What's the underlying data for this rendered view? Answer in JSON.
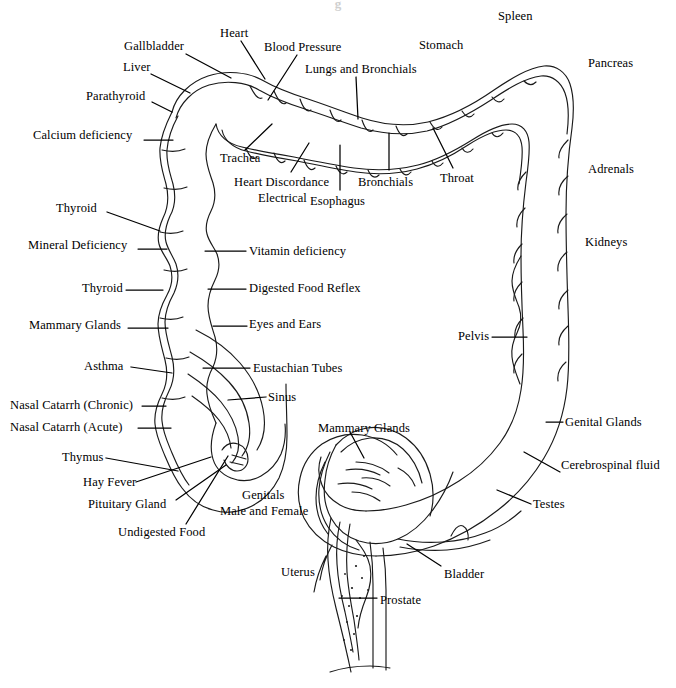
{
  "document": {
    "title_fragment": "g",
    "kind": "colon-reflex-chart",
    "background_color": "#ffffff",
    "ink_color": "#1a1a1a"
  },
  "diagram": {
    "name": "colon-outline",
    "parts": [
      "ascending-colon",
      "hepatic-flexure",
      "transverse-colon",
      "splenic-flexure",
      "descending-colon",
      "sigmoid-colon",
      "cecum",
      "rectum"
    ]
  },
  "labels": [
    {
      "id": "gallbladder",
      "text": "Gallbladder",
      "x": 124,
      "y": 40,
      "align": "left",
      "leader": [
        [
          186,
          54
        ],
        [
          231,
          78
        ]
      ]
    },
    {
      "id": "heart",
      "text": "Heart",
      "x": 220,
      "y": 27,
      "align": "left",
      "leader": [
        [
          241,
          41
        ],
        [
          265,
          79
        ]
      ]
    },
    {
      "id": "blood-pressure",
      "text": "Blood Pressure",
      "x": 264,
      "y": 41,
      "align": "left",
      "leader": [
        [
          297,
          55
        ],
        [
          268,
          100
        ]
      ]
    },
    {
      "id": "liver",
      "text": "Liver",
      "x": 123,
      "y": 61,
      "align": "left",
      "leader": [
        [
          151,
          74
        ],
        [
          190,
          93
        ]
      ]
    },
    {
      "id": "lungs-and-bronchials",
      "text": "Lungs and Bronchials",
      "x": 305,
      "y": 63,
      "align": "left",
      "leader": [
        [
          356,
          77
        ],
        [
          358,
          119
        ]
      ]
    },
    {
      "id": "stomach",
      "text": "Stomach",
      "x": 419,
      "y": 39,
      "align": "left",
      "leader": null
    },
    {
      "id": "spleen",
      "text": "Spleen",
      "x": 498,
      "y": 10,
      "align": "left",
      "leader": null
    },
    {
      "id": "pancreas",
      "text": "Pancreas",
      "x": 588,
      "y": 57,
      "align": "left",
      "leader": null
    },
    {
      "id": "parathyroid",
      "text": "Parathyroid",
      "x": 86,
      "y": 90,
      "align": "left",
      "leader": [
        [
          152,
          102
        ],
        [
          172,
          112
        ]
      ]
    },
    {
      "id": "calcium-deficiency",
      "text": "Calcium deficiency",
      "x": 33,
      "y": 129,
      "align": "left",
      "leader": [
        [
          144,
          140
        ],
        [
          173,
          140
        ]
      ]
    },
    {
      "id": "trachea",
      "text": "Trachea",
      "x": 220,
      "y": 152,
      "align": "left",
      "leader": [
        [
          245,
          150
        ],
        [
          272,
          124
        ]
      ]
    },
    {
      "id": "heart-discordance",
      "text": "Heart Discordance",
      "x": 234,
      "y": 176,
      "align": "left",
      "leader": [
        [
          291,
          172
        ],
        [
          309,
          143
        ]
      ]
    },
    {
      "id": "electrical",
      "text": "Electrical",
      "x": 258,
      "y": 192,
      "align": "left",
      "leader": null
    },
    {
      "id": "esophagus",
      "text": "Esophagus",
      "x": 310,
      "y": 195,
      "align": "left",
      "leader": [
        [
          340,
          190
        ],
        [
          340,
          145
        ]
      ]
    },
    {
      "id": "bronchials",
      "text": "Bronchials",
      "x": 358,
      "y": 176,
      "align": "left",
      "leader": [
        [
          389,
          170
        ],
        [
          389,
          133
        ]
      ]
    },
    {
      "id": "throat",
      "text": "Throat",
      "x": 440,
      "y": 172,
      "align": "left",
      "leader": [
        [
          453,
          168
        ],
        [
          433,
          128
        ]
      ]
    },
    {
      "id": "adrenals",
      "text": "Adrenals",
      "x": 588,
      "y": 163,
      "align": "left",
      "leader": null
    },
    {
      "id": "kidneys",
      "text": "Kidneys",
      "x": 585,
      "y": 236,
      "align": "left",
      "leader": null
    },
    {
      "id": "thyroid-upper",
      "text": "Thyroid",
      "x": 56,
      "y": 202,
      "align": "left",
      "leader": [
        [
          107,
          212
        ],
        [
          160,
          231
        ]
      ]
    },
    {
      "id": "mineral-deficiency",
      "text": "Mineral Deficiency",
      "x": 28,
      "y": 239,
      "align": "left",
      "leader": [
        [
          138,
          249
        ],
        [
          167,
          249
        ]
      ]
    },
    {
      "id": "vitamin-deficiency",
      "text": "Vitamin deficiency",
      "x": 249,
      "y": 245,
      "align": "left",
      "leader": [
        [
          205,
          251
        ],
        [
          246,
          251
        ]
      ]
    },
    {
      "id": "thyroid-lower",
      "text": "Thyroid",
      "x": 82,
      "y": 282,
      "align": "left",
      "leader": [
        [
          126,
          290
        ],
        [
          163,
          290
        ]
      ]
    },
    {
      "id": "digested-food-reflex",
      "text": "Digested Food Reflex",
      "x": 249,
      "y": 282,
      "align": "left",
      "leader": [
        [
          208,
          289
        ],
        [
          246,
          289
        ]
      ]
    },
    {
      "id": "mammary-glands-left",
      "text": "Mammary Glands",
      "x": 29,
      "y": 319,
      "align": "left",
      "leader": [
        [
          128,
          328
        ],
        [
          168,
          328
        ]
      ]
    },
    {
      "id": "eyes-and-ears",
      "text": "Eyes and Ears",
      "x": 249,
      "y": 318,
      "align": "left",
      "leader": [
        [
          213,
          326
        ],
        [
          247,
          326
        ]
      ]
    },
    {
      "id": "pelvis",
      "text": "Pelvis",
      "x": 458,
      "y": 330,
      "align": "left",
      "leader": [
        [
          492,
          337
        ],
        [
          527,
          337
        ]
      ]
    },
    {
      "id": "asthma",
      "text": "Asthma",
      "x": 84,
      "y": 360,
      "align": "left",
      "leader": [
        [
          131,
          367
        ],
        [
          172,
          373
        ]
      ]
    },
    {
      "id": "eustachian-tubes",
      "text": "Eustachian Tubes",
      "x": 253,
      "y": 362,
      "align": "left",
      "leader": [
        [
          203,
          368
        ],
        [
          250,
          368
        ]
      ]
    },
    {
      "id": "nasal-catarrh-chronic",
      "text": "Nasal Catarrh (Chronic)",
      "x": 10,
      "y": 399,
      "align": "left",
      "leader": [
        [
          142,
          406
        ],
        [
          166,
          406
        ]
      ]
    },
    {
      "id": "sinus",
      "text": "Sinus",
      "x": 268,
      "y": 391,
      "align": "left",
      "leader": [
        [
          228,
          400
        ],
        [
          266,
          397
        ]
      ]
    },
    {
      "id": "nasal-catarrh-acute",
      "text": "Nasal Catarrh (Acute)",
      "x": 10,
      "y": 421,
      "align": "left",
      "leader": [
        [
          138,
          428
        ],
        [
          171,
          428
        ]
      ]
    },
    {
      "id": "mammary-glands-right",
      "text": "Mammary Glands",
      "x": 318,
      "y": 422,
      "align": "left",
      "leader": [
        [
          350,
          432
        ],
        [
          364,
          458
        ]
      ]
    },
    {
      "id": "genital-glands",
      "text": "Genital Glands",
      "x": 565,
      "y": 416,
      "align": "left",
      "leader": [
        [
          546,
          422
        ],
        [
          563,
          422
        ]
      ]
    },
    {
      "id": "thymus",
      "text": "Thymus",
      "x": 62,
      "y": 451,
      "align": "left",
      "leader": [
        [
          106,
          458
        ],
        [
          178,
          471
        ]
      ]
    },
    {
      "id": "cerebrospinal-fluid",
      "text": "Cerebrospinal fluid",
      "x": 561,
      "y": 459,
      "align": "left",
      "leader": [
        [
          524,
          452
        ],
        [
          560,
          472
        ]
      ]
    },
    {
      "id": "hay-fever",
      "text": "Hay Fever",
      "x": 83,
      "y": 476,
      "align": "left",
      "leader": [
        [
          136,
          482
        ],
        [
          211,
          457
        ]
      ]
    },
    {
      "id": "pituitary-gland",
      "text": "Pituitary Gland",
      "x": 88,
      "y": 498,
      "align": "left",
      "leader": [
        [
          176,
          500
        ],
        [
          226,
          465
        ]
      ]
    },
    {
      "id": "genitals",
      "text": "Genitals",
      "x": 242,
      "y": 489,
      "align": "left",
      "leader": null
    },
    {
      "id": "male-and-female",
      "text": "Male and Female",
      "x": 220,
      "y": 505,
      "align": "left",
      "leader": null
    },
    {
      "id": "testes",
      "text": "Testes",
      "x": 533,
      "y": 498,
      "align": "left",
      "leader": [
        [
          497,
          490
        ],
        [
          531,
          504
        ]
      ]
    },
    {
      "id": "undigested-food",
      "text": "Undigested Food",
      "x": 118,
      "y": 526,
      "align": "left",
      "leader": [
        [
          186,
          524
        ],
        [
          228,
          456
        ]
      ]
    },
    {
      "id": "uterus",
      "text": "Uterus",
      "x": 281,
      "y": 566,
      "align": "left",
      "leader": null
    },
    {
      "id": "bladder",
      "text": "Bladder",
      "x": 444,
      "y": 568,
      "align": "left",
      "leader": [
        [
          441,
          566
        ],
        [
          407,
          544
        ]
      ]
    },
    {
      "id": "prostate",
      "text": "Prostate",
      "x": 380,
      "y": 594,
      "align": "left",
      "leader": [
        [
          377,
          598
        ],
        [
          339,
          598
        ]
      ]
    }
  ]
}
